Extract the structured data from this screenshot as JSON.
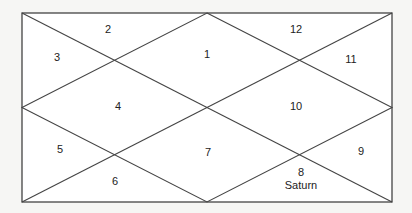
{
  "colors": {
    "background": "#f6f6f4",
    "chart_fill": "#ffffff",
    "line": "#444444",
    "text": "#222222"
  },
  "houses": [
    {
      "number": "1",
      "planets": []
    },
    {
      "number": "2",
      "planets": []
    },
    {
      "number": "3",
      "planets": []
    },
    {
      "number": "4",
      "planets": []
    },
    {
      "number": "5",
      "planets": []
    },
    {
      "number": "6",
      "planets": []
    },
    {
      "number": "7",
      "planets": []
    },
    {
      "number": "8",
      "planets": [
        "Saturn"
      ]
    },
    {
      "number": "9",
      "planets": []
    },
    {
      "number": "10",
      "planets": []
    },
    {
      "number": "11",
      "planets": []
    },
    {
      "number": "12",
      "planets": []
    }
  ]
}
